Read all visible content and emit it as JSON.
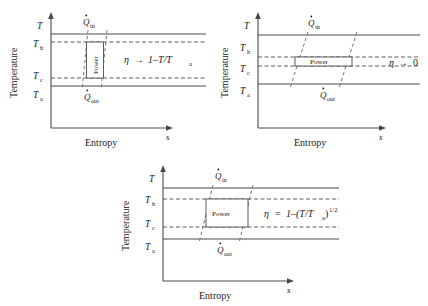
{
  "figure": {
    "axis": {
      "y_label": "Temperature",
      "x_label": "Entropy",
      "x_symbol": "s",
      "top_symbol": "T"
    },
    "tick_labels": [
      {
        "base": "T",
        "sub": ""
      },
      {
        "base": "T",
        "sub": "h"
      },
      {
        "base": "T",
        "sub": "c"
      },
      {
        "base": "T",
        "sub": "a"
      }
    ],
    "flow_labels": {
      "heat_in_base": "Q",
      "heat_in_sub": "in",
      "heat_out_base": "Q",
      "heat_out_sub": "out"
    },
    "power_label": "Power"
  },
  "panels": [
    {
      "id": "panel-reversible-limit",
      "efficiency": {
        "eta": "η",
        "relation": "→",
        "expr_main": "1–T/T",
        "expr_sub": "a",
        "expr_sup": "",
        "full_text": "η → 1–T/Tₐ"
      },
      "power_box_shape": "narrow-vertical"
    },
    {
      "id": "panel-zero-efficiency",
      "efficiency": {
        "eta": "η",
        "relation": "→",
        "expr_main": "0",
        "expr_sub": "",
        "expr_sup": "",
        "full_text": "η → 0"
      },
      "power_box_shape": "wide-horizontal"
    },
    {
      "id": "panel-max-power",
      "efficiency": {
        "eta": "η",
        "relation": "=",
        "expr_main": "1–(T/T",
        "expr_sub": "a",
        "expr_sup": "1/2",
        "full_text": "η = 1–(T/Tₐ)^(1/2)"
      },
      "power_box_shape": "square"
    }
  ],
  "colors": {
    "line": "#4a4a4a",
    "dash": "#6a6a6a",
    "text": "#1a1a1a",
    "background": "#ffffff"
  }
}
